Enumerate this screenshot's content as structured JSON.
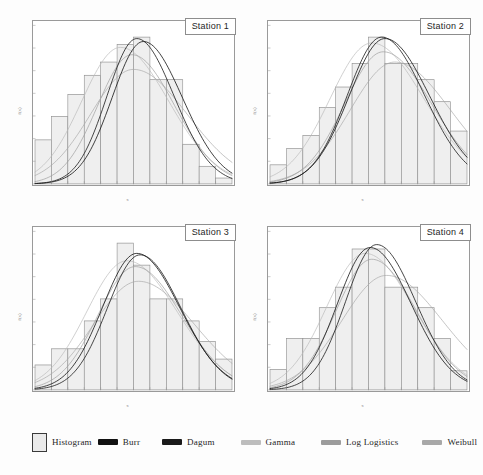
{
  "figure": {
    "title": "",
    "panel_count": 4,
    "layout": "2x2 grid of histogram panels with fitted distribution curves"
  },
  "panels": [
    {
      "id": "station-1",
      "label": "Station 1"
    },
    {
      "id": "station-2",
      "label": "Station 2"
    },
    {
      "id": "station-3",
      "label": "Station 3"
    },
    {
      "id": "station-4",
      "label": "Station 4"
    }
  ],
  "legend": {
    "items": [
      {
        "label": "Histogram",
        "marker": "box",
        "color": "#eaeaea"
      },
      {
        "label": "Burr",
        "marker": "line",
        "color": "#111111"
      },
      {
        "label": "Dagum",
        "marker": "line",
        "color": "#1a1a1a"
      },
      {
        "label": "Gamma",
        "marker": "line",
        "color": "#b9b9b9"
      },
      {
        "label": "Log Logistics",
        "marker": "line",
        "color": "#9c9c9c"
      },
      {
        "label": "Weibull",
        "marker": "line",
        "color": "#a8a8a8"
      }
    ]
  },
  "axes": {
    "ylabel": "f(x)",
    "xlabel": "x",
    "y_ticks": [
      "",
      "",
      "",
      "",
      "",
      "",
      "",
      ""
    ],
    "x_ticks": [
      "",
      "",
      "",
      "",
      "",
      "",
      "",
      "",
      "",
      ""
    ]
  },
  "chart_data": {
    "type": "bar",
    "title": "",
    "xlabel": "x",
    "ylabel": "f(x)",
    "grid": false,
    "legend_position": "bottom",
    "ylim": [
      0,
      1.0
    ],
    "note": "Four histogram panels (Stations 1-4) each overlaid with five fitted probability density curves: Burr, Dagum, Gamma, Log Logistics, Weibull. Bar heights are relative frequencies normalised to the panel maximum.",
    "series_curves": [
      "Burr",
      "Dagum",
      "Gamma",
      "Log Logistics",
      "Weibull"
    ],
    "panels": [
      {
        "name": "Station 1",
        "categories": [
          "1",
          "2",
          "3",
          "4",
          "5",
          "6",
          "7",
          "8",
          "9",
          "10",
          "11",
          "12"
        ],
        "values": [
          0.3,
          0.46,
          0.61,
          0.74,
          0.83,
          0.95,
          1.0,
          0.71,
          0.71,
          0.27,
          0.12,
          0.04
        ],
        "curves": {
          "Burr": {
            "peak_x": 6.6,
            "peak_y": 0.97,
            "spread": 2.1
          },
          "Dagum": {
            "peak_x": 6.2,
            "peak_y": 0.99,
            "spread": 2.0
          },
          "Gamma": {
            "peak_x": 5.2,
            "peak_y": 0.93,
            "spread": 2.6
          },
          "Log Logistics": {
            "peak_x": 5.9,
            "peak_y": 0.88,
            "spread": 2.3
          },
          "Weibull": {
            "peak_x": 6.0,
            "peak_y": 0.78,
            "spread": 2.9
          }
        }
      },
      {
        "name": "Station 2",
        "categories": [
          "1",
          "2",
          "3",
          "4",
          "5",
          "6",
          "7",
          "8",
          "9",
          "10",
          "11",
          "12"
        ],
        "values": [
          0.13,
          0.24,
          0.33,
          0.52,
          0.66,
          0.82,
          1.0,
          0.82,
          0.82,
          0.71,
          0.56,
          0.36
        ],
        "curves": {
          "Burr": {
            "peak_x": 7.0,
            "peak_y": 0.99,
            "spread": 2.4
          },
          "Dagum": {
            "peak_x": 6.8,
            "peak_y": 1.0,
            "spread": 2.3
          },
          "Gamma": {
            "peak_x": 6.2,
            "peak_y": 0.96,
            "spread": 2.8
          },
          "Log Logistics": {
            "peak_x": 6.9,
            "peak_y": 0.9,
            "spread": 2.6
          },
          "Weibull": {
            "peak_x": 7.6,
            "peak_y": 0.83,
            "spread": 3.0
          }
        }
      },
      {
        "name": "Station 3",
        "categories": [
          "1",
          "2",
          "3",
          "4",
          "5",
          "6",
          "7",
          "8",
          "9",
          "10",
          "11",
          "12"
        ],
        "values": [
          0.17,
          0.28,
          0.28,
          0.47,
          0.62,
          1.0,
          0.85,
          0.62,
          0.62,
          0.47,
          0.33,
          0.21
        ],
        "curves": {
          "Burr": {
            "peak_x": 6.2,
            "peak_y": 0.93,
            "spread": 2.3
          },
          "Dagum": {
            "peak_x": 6.4,
            "peak_y": 0.92,
            "spread": 2.2
          },
          "Gamma": {
            "peak_x": 5.6,
            "peak_y": 0.88,
            "spread": 2.7
          },
          "Log Logistics": {
            "peak_x": 6.1,
            "peak_y": 0.84,
            "spread": 2.5
          },
          "Weibull": {
            "peak_x": 6.3,
            "peak_y": 0.74,
            "spread": 3.0
          }
        }
      },
      {
        "name": "Station 4",
        "categories": [
          "1",
          "2",
          "3",
          "4",
          "5",
          "6",
          "7",
          "8",
          "9",
          "10",
          "11",
          "12"
        ],
        "values": [
          0.14,
          0.35,
          0.35,
          0.56,
          0.7,
          0.96,
          0.96,
          0.7,
          0.7,
          0.56,
          0.35,
          0.13
        ],
        "curves": {
          "Burr": {
            "peak_x": 6.1,
            "peak_y": 0.97,
            "spread": 2.2
          },
          "Dagum": {
            "peak_x": 6.5,
            "peak_y": 0.99,
            "spread": 2.1
          },
          "Gamma": {
            "peak_x": 5.8,
            "peak_y": 0.93,
            "spread": 2.6
          },
          "Log Logistics": {
            "peak_x": 6.2,
            "peak_y": 0.89,
            "spread": 2.4
          },
          "Weibull": {
            "peak_x": 7.1,
            "peak_y": 0.78,
            "spread": 3.0
          }
        }
      }
    ]
  }
}
